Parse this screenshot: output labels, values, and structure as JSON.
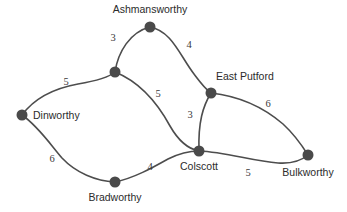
{
  "chart_data": {
    "type": "diagram",
    "diagram_kind": "weighted-undirected-graph",
    "title": "",
    "background_color": "#ffffff",
    "node_color": "#4a4a4a",
    "edge_color": "#4d4d4d",
    "label_color": "#2b2b2b",
    "node_radius": 5.5,
    "nodes": [
      {
        "id": "ashmansworthy",
        "label": "Ashmansworthy",
        "x": 150,
        "y": 27,
        "label_x": 150,
        "label_y": 13,
        "label_anchor": "middle"
      },
      {
        "id": "junction",
        "label": "",
        "x": 115,
        "y": 72,
        "label_x": 115,
        "label_y": 72,
        "label_anchor": "middle"
      },
      {
        "id": "dinworthy",
        "label": "Dinworthy",
        "x": 22,
        "y": 115,
        "label_x": 33,
        "label_y": 119,
        "label_anchor": "start"
      },
      {
        "id": "east_putford",
        "label": "East Putford",
        "x": 211,
        "y": 93,
        "label_x": 216,
        "label_y": 80,
        "label_anchor": "start"
      },
      {
        "id": "colscott",
        "label": "Colscott",
        "x": 199,
        "y": 151,
        "label_x": 199,
        "label_y": 170,
        "label_anchor": "middle"
      },
      {
        "id": "bulkworthy",
        "label": "Bulkworthy",
        "x": 308,
        "y": 155,
        "label_x": 308,
        "label_y": 176,
        "label_anchor": "middle"
      },
      {
        "id": "bradworthy",
        "label": "Bradworthy",
        "x": 115,
        "y": 182,
        "label_x": 115,
        "label_y": 201,
        "label_anchor": "middle"
      }
    ],
    "edges": [
      {
        "id": "junction-ashmansworthy",
        "source": "junction",
        "target": "ashmansworthy",
        "weight": 3,
        "label_x": 113,
        "label_y": 41,
        "path": "M 115 72 C 118 52 130 32 150 27"
      },
      {
        "id": "ashmansworthy-east_putford",
        "source": "ashmansworthy",
        "target": "east_putford",
        "weight": 4,
        "label_x": 189,
        "label_y": 48,
        "path": "M 150 27 C 172 31 180 56 194 74 C 200 82 205 89 211 93"
      },
      {
        "id": "dinworthy-junction",
        "source": "dinworthy",
        "target": "junction",
        "weight": 5,
        "label_x": 66,
        "label_y": 85,
        "path": "M 22 115 C 36 96 56 88 78 84 C 96 81 108 78 115 72"
      },
      {
        "id": "junction-colscott",
        "source": "junction",
        "target": "colscott",
        "weight": 5,
        "label_x": 158,
        "label_y": 97,
        "path": "M 115 72 C 140 82 158 104 170 126 C 178 140 188 149 199 151"
      },
      {
        "id": "east_putford-colscott",
        "source": "east_putford",
        "target": "colscott",
        "weight": 3,
        "label_x": 190,
        "label_y": 118,
        "path": "M 211 93 C 203 106 198 122 199 151"
      },
      {
        "id": "east_putford-bulkworthy",
        "source": "east_putford",
        "target": "bulkworthy",
        "weight": 6,
        "label_x": 268,
        "label_y": 107,
        "path": "M 211 93 C 238 96 262 106 283 124 C 295 135 303 147 308 155"
      },
      {
        "id": "colscott-bulkworthy",
        "source": "colscott",
        "target": "bulkworthy",
        "weight": 5,
        "label_x": 248,
        "label_y": 176,
        "path": "M 199 151 C 226 152 252 161 278 163 C 292 164 302 160 308 155"
      },
      {
        "id": "dinworthy-bradworthy",
        "source": "dinworthy",
        "target": "bradworthy",
        "weight": 6,
        "label_x": 52,
        "label_y": 162,
        "path": "M 22 115 C 38 126 50 144 62 158 C 76 173 96 181 115 182"
      },
      {
        "id": "bradworthy-colscott",
        "source": "bradworthy",
        "target": "colscott",
        "weight": 4,
        "label_x": 150,
        "label_y": 170,
        "path": "M 115 182 C 134 178 152 168 168 159 C 180 153 190 151 199 151"
      }
    ]
  }
}
